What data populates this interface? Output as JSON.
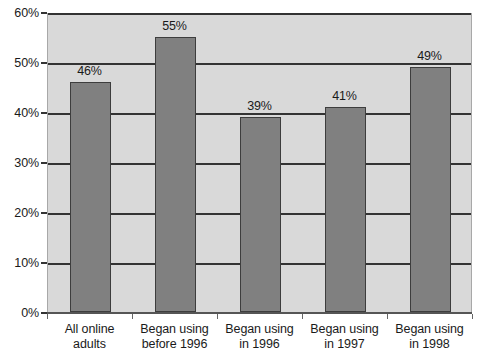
{
  "chart_data": {
    "type": "bar",
    "title": "",
    "subtitle": "",
    "xlabel": "",
    "ylabel": "",
    "ylim": [
      0,
      60
    ],
    "ytick_values": [
      0,
      10,
      20,
      30,
      40,
      50,
      60
    ],
    "ytick_labels": [
      "0%",
      "10%",
      "20%",
      "30%",
      "40%",
      "50%",
      "60%"
    ],
    "grid": "horizontal",
    "legend": "none",
    "categories": [
      "All online adults",
      "Began using before 1996",
      "Began using in 1996",
      "Began using in 1997",
      "Began using in 1998"
    ],
    "category_lines": [
      [
        "All online",
        "adults"
      ],
      [
        "Began using",
        "before 1996"
      ],
      [
        "Began using",
        "in 1996"
      ],
      [
        "Began using",
        "in 1997"
      ],
      [
        "Began using",
        "in 1998"
      ]
    ],
    "values": [
      46,
      55,
      39,
      41,
      49
    ],
    "value_labels": [
      "46%",
      "55%",
      "39%",
      "41%",
      "49%"
    ],
    "colors": {
      "bar_fill": "#808080",
      "bar_border": "#3d3d3d",
      "plot_background": "#d9d9d9",
      "gridline": "#333333",
      "axis": "#555555",
      "text": "#1a1a1a",
      "page_background": "#ffffff"
    }
  }
}
